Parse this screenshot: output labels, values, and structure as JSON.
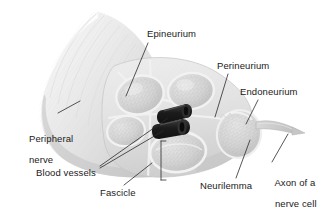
{
  "figure": {
    "type": "anatomical-illustration",
    "background_color": "#ffffff",
    "style": "grayscale"
  },
  "colors": {
    "background": "#ffffff",
    "label_text": "#1a1a1a",
    "leader_line": "#2b2b2b",
    "nerve_light": "#f2f2f2",
    "nerve_mid": "#dcdcdc",
    "nerve_shadow": "#bdbdbd",
    "fascicle_fill": "#d2d2d2",
    "fascicle_rim": "#f4f4f4",
    "blood_vessel": "#1c1c1c",
    "blood_vessel_highlight": "#4a4a4a",
    "axon": "#cfcfcf"
  },
  "labels": [
    {
      "id": "epineurium",
      "text": "Epineurium",
      "x": 147,
      "y": 29,
      "lines": [
        "Epineurium"
      ]
    },
    {
      "id": "perineurium",
      "text": "Perineurium",
      "x": 217,
      "y": 61,
      "lines": [
        "Perineurium"
      ]
    },
    {
      "id": "endoneurium",
      "text": "Endoneurium",
      "x": 240,
      "y": 87,
      "lines": [
        "Endoneurium"
      ]
    },
    {
      "id": "peripheral-nerve",
      "text": "Peripheral nerve",
      "x": 18,
      "y": 123,
      "lines": [
        "Peripheral",
        "nerve"
      ]
    },
    {
      "id": "blood-vessels",
      "text": "Blood vessels",
      "x": 36,
      "y": 168,
      "lines": [
        "Blood vessels"
      ]
    },
    {
      "id": "fascicle",
      "text": "Fascicle",
      "x": 100,
      "y": 188,
      "lines": [
        "Fascicle"
      ]
    },
    {
      "id": "neurilemma",
      "text": "Neurilemma",
      "x": 200,
      "y": 181,
      "lines": [
        "Neurilemma"
      ]
    },
    {
      "id": "axon-of-nerve-cell",
      "text": "Axon of a nerve cell",
      "x": 264,
      "y": 167,
      "lines": [
        "Axon of a",
        "nerve cell"
      ]
    }
  ],
  "structures": [
    {
      "id": "nerve-trunk",
      "name": "Peripheral nerve trunk"
    },
    {
      "id": "epineurium-sheath",
      "name": "Epineurium outer sheath"
    },
    {
      "id": "cross-section",
      "name": "Cut cross-section face"
    },
    {
      "id": "fascicle-1",
      "name": "Fascicle upper left"
    },
    {
      "id": "fascicle-2",
      "name": "Fascicle upper right"
    },
    {
      "id": "fascicle-3",
      "name": "Fascicle lower left"
    },
    {
      "id": "fascicle-4",
      "name": "Fascicle lower center"
    },
    {
      "id": "fascicle-5",
      "name": "Fascicle right bulb"
    },
    {
      "id": "blood-vessel-1",
      "name": "Blood vessel upper tube"
    },
    {
      "id": "blood-vessel-2",
      "name": "Blood vessel lower tube"
    },
    {
      "id": "axon-filament",
      "name": "Axon filament"
    }
  ]
}
